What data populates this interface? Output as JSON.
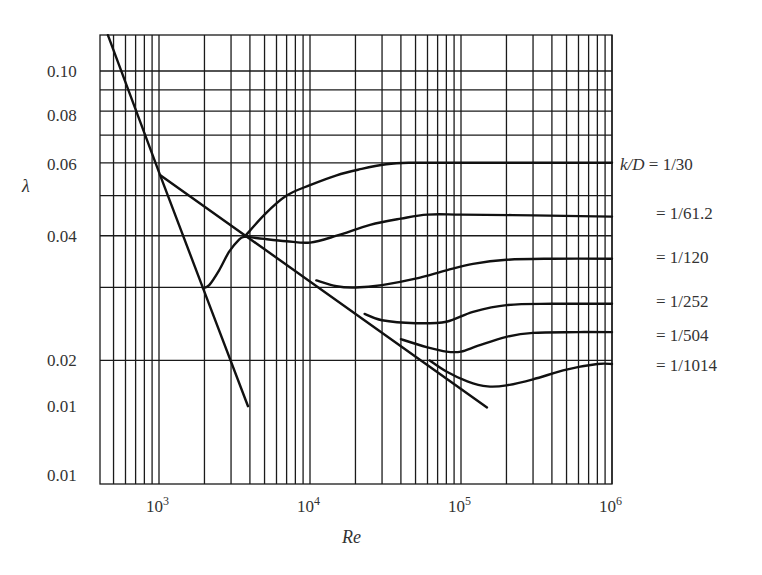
{
  "chart_data": {
    "type": "line",
    "title": "",
    "xlabel": "Re",
    "ylabel": "λ",
    "xscale": "log",
    "yscale": "log",
    "xlim": [
      400,
      1000000
    ],
    "ylim": [
      0.01,
      0.122
    ],
    "grid": true,
    "x_ticks": [
      {
        "value": 1000,
        "label": "10",
        "exp": "3"
      },
      {
        "value": 10000,
        "label": "10",
        "exp": "4"
      },
      {
        "value": 100000,
        "label": "10",
        "exp": "5"
      },
      {
        "value": 1000000,
        "label": "10",
        "exp": "6"
      }
    ],
    "y_ticks": [
      {
        "value": 0.1,
        "label": "0.10"
      },
      {
        "value": 0.08,
        "label": "0.08"
      },
      {
        "value": 0.06,
        "label": "0.06"
      },
      {
        "value": 0.04,
        "label": "0.04"
      },
      {
        "value": 0.02,
        "label": "0.02"
      },
      {
        "value": 0.0155,
        "label": "0.01"
      },
      {
        "value": 0.01,
        "label": "0.01"
      }
    ],
    "x_gridlines": [
      500,
      600,
      700,
      800,
      900,
      1000,
      2000,
      3000,
      4000,
      5000,
      6000,
      7000,
      8000,
      9000,
      10000,
      20000,
      30000,
      40000,
      50000,
      60000,
      70000,
      80000,
      90000,
      100000,
      200000,
      300000,
      400000,
      500000,
      600000,
      700000,
      800000,
      900000,
      1000000
    ],
    "y_gridlines": [
      0.1,
      0.09,
      0.08,
      0.07,
      0.06,
      0.05,
      0.04,
      0.03,
      0.02
    ],
    "legend_position": "right",
    "series": [
      {
        "name": "laminar",
        "label": "",
        "x": [
          459,
          1015,
          1955,
          3887
        ],
        "y": [
          0.122,
          0.0561,
          0.0299,
          0.0155
        ]
      },
      {
        "name": "smooth-pipe",
        "label": "",
        "x": [
          1015,
          148600
        ],
        "y": [
          0.0561,
          0.0154
        ]
      },
      {
        "name": "transition",
        "label": "",
        "x": [
          1955,
          2150,
          2500,
          2900,
          3400,
          3700
        ],
        "y": [
          0.0299,
          0.0304,
          0.033,
          0.0365,
          0.0392,
          0.0398
        ]
      },
      {
        "name": "k/D=1/30",
        "label": "k/D = 1/30",
        "x": [
          3700,
          5000,
          7000,
          10000,
          15000,
          22000,
          32000,
          45000,
          100000,
          1000000
        ],
        "y": [
          0.0398,
          0.045,
          0.05,
          0.053,
          0.056,
          0.058,
          0.0595,
          0.06,
          0.06,
          0.06
        ]
      },
      {
        "name": "k/D=1/61.2",
        "label": "= 1/61.2",
        "x": [
          3700,
          5000,
          7000,
          10000,
          15000,
          25000,
          40000,
          60000,
          100000,
          300000,
          1000000
        ],
        "y": [
          0.0398,
          0.0393,
          0.0388,
          0.0385,
          0.04,
          0.0425,
          0.044,
          0.045,
          0.045,
          0.0448,
          0.0445
        ]
      },
      {
        "name": "k/D=1/120",
        "label": "= 1/120",
        "x": [
          11000,
          15000,
          20000,
          30000,
          50000,
          80000,
          120000,
          200000,
          400000,
          1000000
        ],
        "y": [
          0.0312,
          0.0302,
          0.03,
          0.0304,
          0.0315,
          0.033,
          0.0342,
          0.035,
          0.0352,
          0.0352
        ]
      },
      {
        "name": "k/D=1/252",
        "label": "= 1/252",
        "x": [
          23000,
          30000,
          50000,
          80000,
          120000,
          200000,
          400000,
          1000000
        ],
        "y": [
          0.0259,
          0.025,
          0.0246,
          0.0248,
          0.0262,
          0.0272,
          0.0274,
          0.0274
        ]
      },
      {
        "name": "k/D=1/504",
        "label": "= 1/504",
        "x": [
          40000,
          60000,
          80000,
          100000,
          130000,
          200000,
          300000,
          600000,
          1000000
        ],
        "y": [
          0.0225,
          0.0215,
          0.021,
          0.021,
          0.0217,
          0.0228,
          0.0233,
          0.0234,
          0.0234
        ]
      },
      {
        "name": "k/D=1/1014",
        "label": "= 1/1014",
        "x": [
          62000,
          80000,
          110000,
          150000,
          200000,
          300000,
          500000,
          800000,
          1000000
        ],
        "y": [
          0.02,
          0.0188,
          0.0178,
          0.0173,
          0.0174,
          0.018,
          0.019,
          0.0196,
          0.0196
        ]
      }
    ]
  },
  "plot_area": {
    "left": 100,
    "top": 35,
    "right": 612,
    "bottom": 484
  },
  "labels": {
    "ylabel": "λ",
    "xlabel": "Re",
    "kd_prefix": "k/D",
    "legend": [
      "k/D = 1/30",
      "= 1/61.2",
      "= 1/120",
      "= 1/252",
      "= 1/504",
      "= 1/1014"
    ]
  }
}
